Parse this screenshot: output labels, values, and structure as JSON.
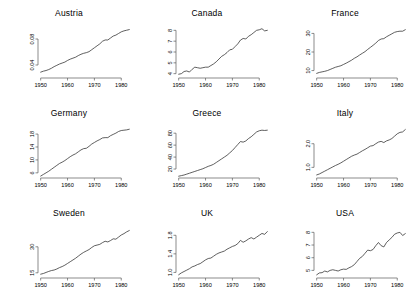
{
  "figure": {
    "layout": "3x3 small multiples",
    "background": "#ffffff",
    "line_color": "#2b2b2b",
    "axis_color": "#5a5a5a"
  },
  "chart_data": [
    {
      "type": "line",
      "title": "Austria",
      "xlabel": "",
      "ylabel": "",
      "grid": false,
      "legend": false,
      "xlim": [
        1949,
        1984
      ],
      "ylim": [
        0.02,
        0.1
      ],
      "xticks": [
        1950,
        1960,
        1970,
        1980
      ],
      "xticklabels": [
        "1950",
        "1960",
        "1970",
        "1980"
      ],
      "yticks": [
        0.04,
        0.08
      ],
      "yticklabels": [
        "0.04",
        "0.08"
      ],
      "x": [
        1950,
        1951,
        1952,
        1953,
        1954,
        1955,
        1956,
        1957,
        1958,
        1959,
        1960,
        1961,
        1962,
        1963,
        1964,
        1965,
        1966,
        1967,
        1968,
        1969,
        1970,
        1971,
        1972,
        1973,
        1974,
        1975,
        1976,
        1977,
        1978,
        1979,
        1980,
        1981,
        1982,
        1983
      ],
      "y": [
        0.029,
        0.0305,
        0.0315,
        0.033,
        0.035,
        0.0375,
        0.0395,
        0.0415,
        0.043,
        0.0445,
        0.047,
        0.049,
        0.0505,
        0.052,
        0.0545,
        0.0565,
        0.058,
        0.059,
        0.0605,
        0.0635,
        0.0665,
        0.0695,
        0.0725,
        0.0765,
        0.0785,
        0.0785,
        0.0815,
        0.0845,
        0.086,
        0.0885,
        0.091,
        0.0925,
        0.0935,
        0.0945
      ]
    },
    {
      "type": "line",
      "title": "Canada",
      "xlabel": "",
      "ylabel": "",
      "grid": false,
      "legend": false,
      "xlim": [
        1949,
        1984
      ],
      "ylim": [
        3.6,
        8.4
      ],
      "xticks": [
        1950,
        1960,
        1970,
        1980
      ],
      "xticklabels": [
        "1950",
        "1960",
        "1970",
        "1980"
      ],
      "yticks": [
        4,
        5,
        6,
        7,
        8
      ],
      "yticklabels": [
        "4",
        "5",
        "6",
        "7",
        "8"
      ],
      "x": [
        1950,
        1951,
        1952,
        1953,
        1954,
        1955,
        1956,
        1957,
        1958,
        1959,
        1960,
        1961,
        1962,
        1963,
        1964,
        1965,
        1966,
        1967,
        1968,
        1969,
        1970,
        1971,
        1972,
        1973,
        1974,
        1975,
        1976,
        1977,
        1978,
        1979,
        1980,
        1981,
        1982,
        1983
      ],
      "y": [
        3.95,
        4.0,
        4.2,
        4.25,
        4.15,
        4.4,
        4.6,
        4.55,
        4.5,
        4.55,
        4.6,
        4.6,
        4.75,
        4.9,
        5.1,
        5.35,
        5.6,
        5.75,
        5.95,
        6.2,
        6.25,
        6.5,
        6.75,
        7.1,
        7.25,
        7.2,
        7.45,
        7.6,
        7.8,
        8.0,
        8.05,
        8.15,
        7.95,
        8.0
      ]
    },
    {
      "type": "line",
      "title": "France",
      "xlabel": "",
      "ylabel": "",
      "grid": false,
      "legend": false,
      "xlim": [
        1949,
        1984
      ],
      "ylim": [
        6,
        34
      ],
      "xticks": [
        1950,
        1960,
        1970,
        1980
      ],
      "xticklabels": [
        "1950",
        "1960",
        "1970",
        "1980"
      ],
      "yticks": [
        10,
        20,
        30
      ],
      "yticklabels": [
        "10",
        "20",
        "30"
      ],
      "x": [
        1950,
        1951,
        1952,
        1953,
        1954,
        1955,
        1956,
        1957,
        1958,
        1959,
        1960,
        1961,
        1962,
        1963,
        1964,
        1965,
        1966,
        1967,
        1968,
        1969,
        1970,
        1971,
        1972,
        1973,
        1974,
        1975,
        1976,
        1977,
        1978,
        1979,
        1980,
        1981,
        1982,
        1983
      ],
      "y": [
        8.5,
        9.0,
        9.3,
        9.6,
        10.0,
        10.6,
        11.2,
        11.8,
        12.2,
        12.6,
        13.3,
        14.0,
        14.8,
        15.6,
        16.6,
        17.4,
        18.4,
        19.3,
        20.2,
        21.4,
        22.5,
        23.6,
        24.8,
        26.2,
        27.0,
        27.2,
        28.2,
        29.0,
        29.8,
        30.6,
        31.0,
        31.2,
        31.2,
        32.0
      ]
    },
    {
      "type": "line",
      "title": "Germany",
      "xlabel": "",
      "ylabel": "",
      "grid": false,
      "legend": false,
      "xlim": [
        1949,
        1984
      ],
      "ylim": [
        4.4,
        20.5
      ],
      "xticks": [
        1950,
        1960,
        1970,
        1980
      ],
      "xticklabels": [
        "1950",
        "1960",
        "1970",
        "1980"
      ],
      "yticks": [
        6,
        10,
        14,
        18
      ],
      "yticklabels": [
        "6",
        "10",
        "14",
        "18"
      ],
      "x": [
        1950,
        1951,
        1952,
        1953,
        1954,
        1955,
        1956,
        1957,
        1958,
        1959,
        1960,
        1961,
        1962,
        1963,
        1964,
        1965,
        1966,
        1967,
        1968,
        1969,
        1970,
        1971,
        1972,
        1973,
        1974,
        1975,
        1976,
        1977,
        1978,
        1979,
        1980,
        1981,
        1982,
        1983
      ],
      "y": [
        5.0,
        5.5,
        6.0,
        6.5,
        7.1,
        7.7,
        8.3,
        8.9,
        9.3,
        9.8,
        10.4,
        11.0,
        11.5,
        11.9,
        12.5,
        13.1,
        13.5,
        13.6,
        14.2,
        14.9,
        15.4,
        15.9,
        16.3,
        16.8,
        16.9,
        16.9,
        17.5,
        17.9,
        18.3,
        18.8,
        19.1,
        19.2,
        19.3,
        19.5
      ]
    },
    {
      "type": "line",
      "title": "Greece",
      "xlabel": "",
      "ylabel": "",
      "grid": false,
      "legend": false,
      "xlim": [
        1949,
        1984
      ],
      "ylim": [
        5,
        92
      ],
      "xticks": [
        1950,
        1960,
        1970,
        1980
      ],
      "xticklabels": [
        "1950",
        "1960",
        "1970",
        "1980"
      ],
      "yticks": [
        20,
        40,
        60,
        80
      ],
      "yticklabels": [
        "20",
        "40",
        "60",
        "80"
      ],
      "x": [
        1950,
        1951,
        1952,
        1953,
        1954,
        1955,
        1956,
        1957,
        1958,
        1959,
        1960,
        1961,
        1962,
        1963,
        1964,
        1965,
        1966,
        1967,
        1968,
        1969,
        1970,
        1971,
        1972,
        1973,
        1974,
        1975,
        1976,
        1977,
        1978,
        1979,
        1980,
        1981,
        1982,
        1983
      ],
      "y": [
        8,
        9,
        10,
        11.5,
        13,
        14.5,
        16,
        17.5,
        19,
        20.5,
        22.5,
        24.5,
        26,
        28,
        31,
        34,
        37,
        40,
        43,
        47,
        51,
        56,
        61,
        66,
        65,
        67,
        71,
        74,
        78,
        82,
        84,
        85,
        84.5,
        85
      ]
    },
    {
      "type": "line",
      "title": "Italy",
      "xlabel": "",
      "ylabel": "",
      "grid": false,
      "legend": false,
      "xlim": [
        1949,
        1984
      ],
      "ylim": [
        0.55,
        2.75
      ],
      "xticks": [
        1950,
        1960,
        1970,
        1980
      ],
      "xticklabels": [
        "1950",
        "1960",
        "1970",
        "1980"
      ],
      "yticks": [
        1.0,
        2.0
      ],
      "yticklabels": [
        "1.0",
        "2.0"
      ],
      "x": [
        1950,
        1951,
        1952,
        1953,
        1954,
        1955,
        1956,
        1957,
        1958,
        1959,
        1960,
        1961,
        1962,
        1963,
        1964,
        1965,
        1966,
        1967,
        1968,
        1969,
        1970,
        1971,
        1972,
        1973,
        1974,
        1975,
        1976,
        1977,
        1978,
        1979,
        1980,
        1981,
        1982,
        1983
      ],
      "y": [
        0.68,
        0.72,
        0.78,
        0.84,
        0.9,
        0.96,
        1.02,
        1.08,
        1.13,
        1.19,
        1.26,
        1.33,
        1.4,
        1.47,
        1.52,
        1.56,
        1.63,
        1.7,
        1.76,
        1.83,
        1.9,
        1.92,
        2.0,
        2.07,
        2.1,
        2.05,
        2.12,
        2.16,
        2.22,
        2.32,
        2.42,
        2.48,
        2.5,
        2.6
      ]
    },
    {
      "type": "line",
      "title": "Sweden",
      "xlabel": "",
      "ylabel": "",
      "grid": false,
      "legend": false,
      "xlim": [
        1949,
        1984
      ],
      "ylim": [
        12,
        42
      ],
      "xticks": [
        1950,
        1960,
        1970,
        1980
      ],
      "xticklabels": [
        "1950",
        "1960",
        "1970",
        "1980"
      ],
      "yticks": [
        15,
        30
      ],
      "yticklabels": [
        "15",
        "30"
      ],
      "x": [
        1950,
        1951,
        1952,
        1953,
        1954,
        1955,
        1956,
        1957,
        1958,
        1959,
        1960,
        1961,
        1962,
        1963,
        1964,
        1965,
        1966,
        1967,
        1968,
        1969,
        1970,
        1971,
        1972,
        1973,
        1974,
        1975,
        1976,
        1977,
        1978,
        1979,
        1980,
        1981,
        1982,
        1983
      ],
      "y": [
        14.2,
        14.6,
        15.2,
        15.8,
        16.3,
        16.6,
        17.2,
        18.0,
        18.6,
        19.4,
        20.4,
        21.4,
        22.4,
        23.4,
        24.6,
        25.8,
        26.8,
        27.6,
        28.4,
        29.6,
        30.6,
        31.0,
        31.4,
        32.4,
        33.2,
        32.8,
        33.6,
        34.6,
        34.4,
        35.6,
        36.8,
        37.6,
        38.6,
        39.4
      ]
    },
    {
      "type": "line",
      "title": "UK",
      "xlabel": "",
      "ylabel": "",
      "grid": false,
      "legend": false,
      "xlim": [
        1949,
        1984
      ],
      "ylim": [
        0.88,
        2.0
      ],
      "xticks": [
        1950,
        1960,
        1970,
        1980
      ],
      "xticklabels": [
        "1950",
        "1960",
        "1970",
        "1980"
      ],
      "yticks": [
        1.0,
        1.4,
        1.8
      ],
      "yticklabels": [
        "1.0",
        "1.4",
        "1.8"
      ],
      "x": [
        1950,
        1951,
        1952,
        1953,
        1954,
        1955,
        1956,
        1957,
        1958,
        1959,
        1960,
        1961,
        1962,
        1963,
        1964,
        1965,
        1966,
        1967,
        1968,
        1969,
        1970,
        1971,
        1972,
        1973,
        1974,
        1975,
        1976,
        1977,
        1978,
        1979,
        1980,
        1981,
        1982,
        1983
      ],
      "y": [
        0.95,
        0.99,
        1.02,
        1.05,
        1.08,
        1.12,
        1.14,
        1.17,
        1.19,
        1.23,
        1.27,
        1.3,
        1.31,
        1.35,
        1.39,
        1.42,
        1.44,
        1.46,
        1.5,
        1.53,
        1.56,
        1.58,
        1.62,
        1.69,
        1.65,
        1.68,
        1.72,
        1.75,
        1.72,
        1.76,
        1.8,
        1.84,
        1.82,
        1.88
      ]
    },
    {
      "type": "line",
      "title": "USA",
      "xlabel": "",
      "ylabel": "",
      "grid": false,
      "legend": false,
      "xlim": [
        1949,
        1984
      ],
      "ylim": [
        4.4,
        8.5
      ],
      "xticks": [
        1950,
        1960,
        1970,
        1980
      ],
      "xticklabels": [
        "1950",
        "1960",
        "1970",
        "1980"
      ],
      "yticks": [
        5,
        6,
        7,
        8
      ],
      "yticklabels": [
        "5",
        "6",
        "7",
        "8"
      ],
      "x": [
        1950,
        1951,
        1952,
        1953,
        1954,
        1955,
        1956,
        1957,
        1958,
        1959,
        1960,
        1961,
        1962,
        1963,
        1964,
        1965,
        1966,
        1967,
        1968,
        1969,
        1970,
        1971,
        1972,
        1973,
        1974,
        1975,
        1976,
        1977,
        1978,
        1979,
        1980,
        1981,
        1982,
        1983
      ],
      "y": [
        4.65,
        4.8,
        4.82,
        4.95,
        4.88,
        5.0,
        5.05,
        5.0,
        4.95,
        5.05,
        5.1,
        5.08,
        5.2,
        5.3,
        5.45,
        5.7,
        5.95,
        6.1,
        6.35,
        6.6,
        6.55,
        6.65,
        6.95,
        7.2,
        6.95,
        6.85,
        7.2,
        7.4,
        7.6,
        7.85,
        7.95,
        8.0,
        7.75,
        7.9
      ]
    }
  ]
}
